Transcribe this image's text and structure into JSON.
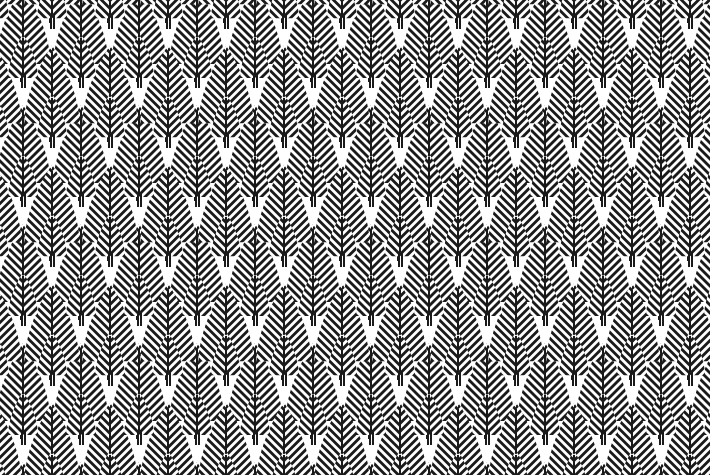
{
  "artwork": {
    "title": "Chevron Tree Seamless Pattern",
    "style": "art-deco-geometric",
    "motif_name": "striped-chevron-tree",
    "canvas": {
      "width": 710,
      "height": 475
    },
    "colors": {
      "background": "#ffffff",
      "ink": "#1a1a1a"
    },
    "tile": {
      "width": 58,
      "height": 119,
      "columns": 13,
      "rows": 5,
      "stagger_x": 29,
      "stagger_y": 59.5
    },
    "stripes": {
      "line_width": 2,
      "line_gap": 2,
      "period": 4,
      "orientation": "chevron-downward"
    },
    "large_tree": {
      "label": "large tree",
      "width": 58,
      "height": 96,
      "apex_y": 0,
      "base_y": 78,
      "trunk_width": 4,
      "trunk_height": 18,
      "trunk_split": true
    },
    "small_tree": {
      "label": "small tree",
      "width": 32,
      "height": 54,
      "apex_y": 0,
      "base_y": 44,
      "trunk_width": 3,
      "trunk_height": 10,
      "trunk_split": true
    }
  }
}
